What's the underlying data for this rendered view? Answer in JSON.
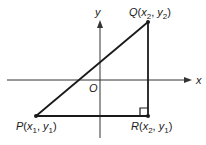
{
  "diagram": {
    "axes": {
      "x_label": "x",
      "y_label": "y",
      "origin_label": "O"
    },
    "points": [
      {
        "name": "P",
        "coords": [
          "x",
          "1",
          "y",
          "1"
        ],
        "px": [
          36,
          116
        ]
      },
      {
        "name": "Q",
        "coords": [
          "x",
          "2",
          "y",
          "2"
        ],
        "px": [
          148,
          22
        ]
      },
      {
        "name": "R",
        "coords": [
          "x",
          "2",
          "y",
          "1"
        ],
        "px": [
          148,
          116
        ]
      }
    ],
    "segments": [
      {
        "from": "P",
        "to": "Q"
      },
      {
        "from": "Q",
        "to": "R"
      },
      {
        "from": "P",
        "to": "R"
      }
    ],
    "right_angle_at": "R",
    "colors": {
      "line": "#1a1a1a",
      "axis": "#333333",
      "background": "#ffffff"
    }
  }
}
